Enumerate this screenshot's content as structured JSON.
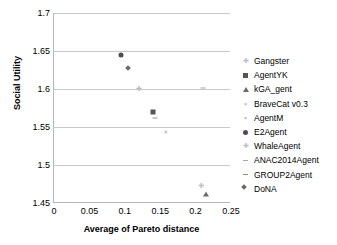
{
  "chart_data": {
    "type": "scatter",
    "title": "",
    "xlabel": "Average of Pareto distance",
    "ylabel": "Social Utility",
    "xlim": [
      0,
      0.25
    ],
    "ylim": [
      1.45,
      1.7
    ],
    "xticks": [
      "0",
      "0.05",
      "0.1",
      "0.15",
      "0.2",
      "0.25"
    ],
    "xtick_values": [
      0,
      0.05,
      0.1,
      0.15,
      0.2,
      0.25
    ],
    "yticks": [
      "1.45",
      "1.5",
      "1.55",
      "1.6",
      "1.65",
      "1.7"
    ],
    "ytick_values": [
      1.45,
      1.5,
      1.55,
      1.6,
      1.65,
      1.7
    ],
    "grid": "horizontal",
    "legend_position": "right",
    "series": [
      {
        "name": "Gangster",
        "marker": "plus",
        "x": 0.208,
        "y": 1.473
      },
      {
        "name": "AgentYK",
        "marker": "square",
        "x": 0.14,
        "y": 1.57
      },
      {
        "name": "kGA_gent",
        "marker": "triangle",
        "x": 0.215,
        "y": 1.462
      },
      {
        "name": "BraveCat v0.3",
        "marker": "cross",
        "x": 0.158,
        "y": 1.544
      },
      {
        "name": "AgentM",
        "marker": "cross",
        "x": null,
        "y": null
      },
      {
        "name": "E2Agent",
        "marker": "circle",
        "x": 0.095,
        "y": 1.645
      },
      {
        "name": "WhaleAgent",
        "marker": "plus",
        "x": 0.12,
        "y": 1.6
      },
      {
        "name": "ANAC2014Agent",
        "marker": "dash",
        "x": 0.21,
        "y": 1.601
      },
      {
        "name": "GROUP2Agent",
        "marker": "dash-dark",
        "x": 0.143,
        "y": 1.562
      },
      {
        "name": "DoNA",
        "marker": "diamond",
        "x": 0.104,
        "y": 1.627
      }
    ]
  },
  "legend": {
    "items": [
      {
        "label": "Gangster",
        "marker": "plus"
      },
      {
        "label": "AgentYK",
        "marker": "square"
      },
      {
        "label": "kGA_gent",
        "marker": "triangle"
      },
      {
        "label": "BraveCat v0.3",
        "marker": "cross"
      },
      {
        "label": "AgentM",
        "marker": "cross"
      },
      {
        "label": "E2Agent",
        "marker": "circle"
      },
      {
        "label": "WhaleAgent",
        "marker": "plus"
      },
      {
        "label": "ANAC2014Agent",
        "marker": "dash"
      },
      {
        "label": "GROUP2Agent",
        "marker": "dash-dark"
      },
      {
        "label": "DoNA",
        "marker": "diamond"
      }
    ]
  },
  "colors": {
    "gridline": "#c9c9c9",
    "axis": "#b8b8b8",
    "text": "#000000",
    "marker_dark": "#4d4d4d",
    "marker_mid": "#8f8f8f",
    "marker_light": "#bdbdbd",
    "background": "#ffffff"
  }
}
